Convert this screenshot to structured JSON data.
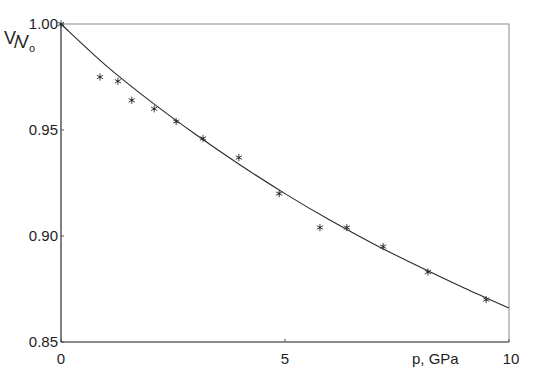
{
  "chart_data": {
    "type": "scatter",
    "title": "",
    "xlabel": "p, GPa",
    "ylabel": "V/V0",
    "ylabel_parts": {
      "numerator": "V",
      "slash": "/",
      "denominator": "V",
      "subscript": "o"
    },
    "xlim": [
      0,
      10
    ],
    "ylim": [
      0.85,
      1.0
    ],
    "x_ticks": [
      0,
      5,
      10
    ],
    "x_tick_labels": [
      "0",
      "5",
      "10"
    ],
    "y_ticks": [
      0.85,
      0.9,
      0.95,
      1.0
    ],
    "y_tick_labels": [
      "0.85",
      "0.90",
      "0.95",
      "1.00"
    ],
    "grid": false,
    "legend": null,
    "series": [
      {
        "name": "measured",
        "kind": "scatter",
        "marker": "asterisk",
        "x": [
          0.0,
          0.87,
          1.27,
          1.58,
          2.08,
          2.57,
          3.17,
          3.97,
          4.87,
          5.78,
          6.38,
          7.19,
          8.19,
          9.49
        ],
        "y": [
          1.0,
          0.975,
          0.973,
          0.964,
          0.96,
          0.954,
          0.946,
          0.937,
          0.92,
          0.904,
          0.904,
          0.895,
          0.883,
          0.87
        ]
      },
      {
        "name": "fit",
        "kind": "line",
        "x": [
          0,
          1,
          2,
          3,
          4,
          5,
          6,
          7,
          8,
          9,
          10
        ],
        "y": [
          1.0,
          0.9805,
          0.9635,
          0.948,
          0.9335,
          0.92,
          0.9075,
          0.896,
          0.8855,
          0.8755,
          0.866
        ]
      }
    ]
  },
  "colors": {
    "background": "#ffffff",
    "axis": "#555555",
    "line": "#2a2a2a",
    "marker": "#2a2a2a",
    "text": "#1e1e1e"
  }
}
